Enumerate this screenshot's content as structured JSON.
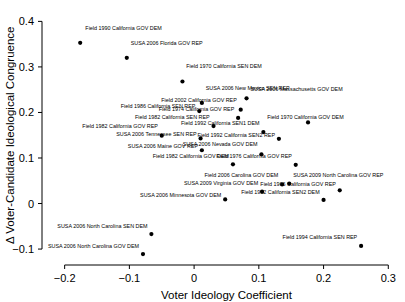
{
  "chart_data": {
    "type": "scatter",
    "title": "",
    "xlabel": "Voter Ideology Coefficient",
    "ylabel": "Δ Voter-Candidate Ideological Congruence",
    "xlim": [
      -0.235,
      0.315
    ],
    "ylim": [
      -0.135,
      0.425
    ],
    "xticks": [
      -0.2,
      -0.1,
      0,
      0.1,
      0.2,
      0.3
    ],
    "xticklabels": [
      "−0.2",
      "−0.1",
      "0",
      "0.1",
      "0.2",
      "0.3"
    ],
    "yticks": [
      -0.1,
      0,
      0.1,
      0.2,
      0.3,
      0.4
    ],
    "yticklabels": [
      "−0.1",
      "0",
      "0.1",
      "0.2",
      "0.3",
      "0.4"
    ],
    "grid": false,
    "legend": null,
    "marker": "filled-circle",
    "marker_color": "#000000",
    "points": [
      {
        "label": "Field 1990 California GOV DEM",
        "x": -0.176,
        "y": 0.353,
        "lx": -0.168,
        "ly": 0.382,
        "anchor": "start"
      },
      {
        "label": "SUSA 2006 Florida GOV REP",
        "x": -0.104,
        "y": 0.32,
        "lx": -0.098,
        "ly": 0.349,
        "anchor": "start"
      },
      {
        "label": "Field 1970 California SEN DEM",
        "x": -0.018,
        "y": 0.268,
        "lx": -0.012,
        "ly": 0.297,
        "anchor": "start"
      },
      {
        "label": "SUSA 2006 New Mexico SEN REP",
        "x": 0.012,
        "y": 0.221,
        "lx": 0.018,
        "ly": 0.25,
        "anchor": "start"
      },
      {
        "label": "SUSA 2006 Massachusetts GOV DEM",
        "x": 0.081,
        "y": 0.231,
        "lx": 0.087,
        "ly": 0.248,
        "anchor": "start"
      },
      {
        "label": "Field 1986 California SEN REP",
        "x": 0.008,
        "y": 0.203,
        "lx": 0.002,
        "ly": 0.209,
        "anchor": "end"
      },
      {
        "label": "Field 2002 California GOV REP",
        "x": 0.072,
        "y": 0.206,
        "lx": 0.066,
        "ly": 0.222,
        "anchor": "end"
      },
      {
        "label": "Field 1974 California GOV REP",
        "x": 0.068,
        "y": 0.188,
        "lx": 0.062,
        "ly": 0.203,
        "anchor": "end"
      },
      {
        "label": "Field 1982 California SEN REP",
        "x": 0.03,
        "y": 0.17,
        "lx": 0.024,
        "ly": 0.186,
        "anchor": "end"
      },
      {
        "label": "Field 1970 California GOV DEM",
        "x": 0.176,
        "y": 0.178,
        "lx": 0.113,
        "ly": 0.186,
        "anchor": "start"
      },
      {
        "label": "Field 1992 California SEN1 DEM",
        "x": 0.107,
        "y": 0.157,
        "lx": 0.101,
        "ly": 0.172,
        "anchor": "end"
      },
      {
        "label": "Field 1982 California GOV REP",
        "x": -0.05,
        "y": 0.149,
        "lx": -0.056,
        "ly": 0.165,
        "anchor": "end"
      },
      {
        "label": "SUSA 2006 Tennessee SEN REP",
        "x": 0.01,
        "y": 0.143,
        "lx": 0.004,
        "ly": 0.148,
        "anchor": "end"
      },
      {
        "label": "Field 1992 California SEN2 REP",
        "x": 0.131,
        "y": 0.142,
        "lx": 0.125,
        "ly": 0.147,
        "anchor": "end"
      },
      {
        "label": "SUSA 2006 Maine GOV REP",
        "x": 0.012,
        "y": 0.117,
        "lx": 0.006,
        "ly": 0.122,
        "anchor": "end"
      },
      {
        "label": "SUSA 2006 Nevada GOV DEM",
        "x": 0.104,
        "y": 0.108,
        "lx": 0.098,
        "ly": 0.126,
        "anchor": "end"
      },
      {
        "label": "Field 1982 California GOV DEM",
        "x": 0.06,
        "y": 0.086,
        "lx": 0.054,
        "ly": 0.101,
        "anchor": "end"
      },
      {
        "label": "Field 1976 California GOV REP",
        "x": 0.157,
        "y": 0.085,
        "lx": 0.151,
        "ly": 0.101,
        "anchor": "end"
      },
      {
        "label": "Field 2006 Carolina GOV DEM",
        "x": 0.136,
        "y": 0.042,
        "lx": 0.13,
        "ly": 0.058,
        "anchor": "end"
      },
      {
        "label": "SUSA 2009 North Carolina GOV REP",
        "x": 0.147,
        "y": 0.044,
        "lx": 0.153,
        "ly": 0.058,
        "anchor": "start"
      },
      {
        "label": "SUSA 2009 Virginia GOV DEM",
        "x": 0.105,
        "y": 0.026,
        "lx": 0.099,
        "ly": 0.041,
        "anchor": "end"
      },
      {
        "label": "Field 1966 California GOV REP",
        "x": 0.225,
        "y": 0.029,
        "lx": 0.219,
        "ly": 0.039,
        "anchor": "end"
      },
      {
        "label": "Field 1992 California SEN2 DEM",
        "x": 0.2,
        "y": 0.008,
        "lx": 0.194,
        "ly": 0.022,
        "anchor": "end"
      },
      {
        "label": "SUSA 2006 Minnesota GOV DEM",
        "x": 0.048,
        "y": 0.009,
        "lx": 0.042,
        "ly": 0.015,
        "anchor": "end"
      },
      {
        "label": "SUSA 2006 North Carolina SEN DEM",
        "x": -0.066,
        "y": -0.067,
        "lx": -0.072,
        "ly": -0.053,
        "anchor": "end"
      },
      {
        "label": "Field 1994 California SEN REP",
        "x": 0.258,
        "y": -0.093,
        "lx": 0.252,
        "ly": -0.078,
        "anchor": "end"
      },
      {
        "label": "SUSA 2006 North Carolina GOV DEM",
        "x": -0.079,
        "y": -0.111,
        "lx": -0.085,
        "ly": -0.097,
        "anchor": "end"
      }
    ]
  },
  "axes": {
    "x_title": "Voter Ideology Coefficient",
    "y_title": "Δ Voter-Candidate Ideological Congruence"
  }
}
